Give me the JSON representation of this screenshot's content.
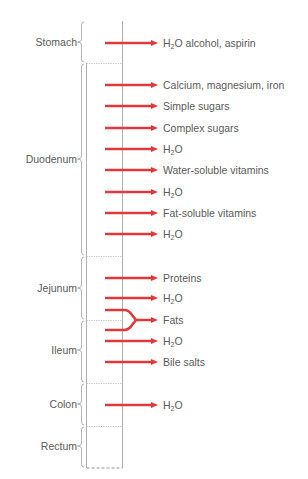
{
  "colors": {
    "arrow": "#e0393b",
    "tube_line": "#9a9a9a",
    "boundary_dotted": "#a8a8a8",
    "label_text": "#5a5a5a"
  },
  "segments": [
    {
      "name": "Stomach",
      "top": 21,
      "bottom": 63,
      "label_y": 42
    },
    {
      "name": "Duodenum",
      "top": 63,
      "bottom": 256,
      "label_y": 159
    },
    {
      "name": "Jejunum",
      "top": 256,
      "bottom": 320,
      "label_y": 288
    },
    {
      "name": "Ileum",
      "top": 320,
      "bottom": 383,
      "label_y": 350
    },
    {
      "name": "Colon",
      "top": 383,
      "bottom": 426,
      "label_y": 404
    },
    {
      "name": "Rectum",
      "top": 426,
      "bottom": 468,
      "label_y": 446
    }
  ],
  "absorbed": [
    {
      "segment": "Stomach",
      "y": 43,
      "label": "H2O alcohol, aspirin",
      "text_prefix": "H",
      "text_sub": "2",
      "text_rest": "O alcohol, aspirin"
    },
    {
      "segment": "Duodenum",
      "y": 85,
      "label": "Calcium, magnesium, iron",
      "text_prefix": "Calcium, magnesium, iron",
      "text_sub": "",
      "text_rest": ""
    },
    {
      "segment": "Duodenum",
      "y": 106,
      "label": "Simple sugars",
      "text_prefix": "Simple sugars",
      "text_sub": "",
      "text_rest": ""
    },
    {
      "segment": "Duodenum",
      "y": 128,
      "label": "Complex sugars",
      "text_prefix": "Complex sugars",
      "text_sub": "",
      "text_rest": ""
    },
    {
      "segment": "Duodenum",
      "y": 149,
      "label": "H2O",
      "text_prefix": "H",
      "text_sub": "2",
      "text_rest": "O"
    },
    {
      "segment": "Duodenum",
      "y": 170,
      "label": "Water-soluble vitamins",
      "text_prefix": "Water-soluble vitamins",
      "text_sub": "",
      "text_rest": ""
    },
    {
      "segment": "Duodenum",
      "y": 192,
      "label": "H2O",
      "text_prefix": "H",
      "text_sub": "2",
      "text_rest": "O"
    },
    {
      "segment": "Duodenum",
      "y": 213,
      "label": "Fat-soluble vitamins",
      "text_prefix": "Fat-soluble vitamins",
      "text_sub": "",
      "text_rest": ""
    },
    {
      "segment": "Duodenum",
      "y": 234,
      "label": "H2O",
      "text_prefix": "H",
      "text_sub": "2",
      "text_rest": "O"
    },
    {
      "segment": "Jejunum",
      "y": 278,
      "label": "Proteins",
      "text_prefix": "Proteins",
      "text_sub": "",
      "text_rest": ""
    },
    {
      "segment": "Jejunum",
      "y": 298,
      "label": "H2O",
      "text_prefix": "H",
      "text_sub": "2",
      "text_rest": "O"
    },
    {
      "segment": "Jejunum/Ileum",
      "y": 320,
      "label": "Fats",
      "text_prefix": "Fats",
      "text_sub": "",
      "text_rest": "",
      "forked": true
    },
    {
      "segment": "Ileum",
      "y": 341,
      "label": "H2O",
      "text_prefix": "H",
      "text_sub": "2",
      "text_rest": "O"
    },
    {
      "segment": "Ileum",
      "y": 362,
      "label": "Bile salts",
      "text_prefix": "Bile salts",
      "text_sub": "",
      "text_rest": ""
    },
    {
      "segment": "Colon",
      "y": 405,
      "label": "H2O",
      "text_prefix": "H",
      "text_sub": "2",
      "text_rest": "O"
    }
  ]
}
